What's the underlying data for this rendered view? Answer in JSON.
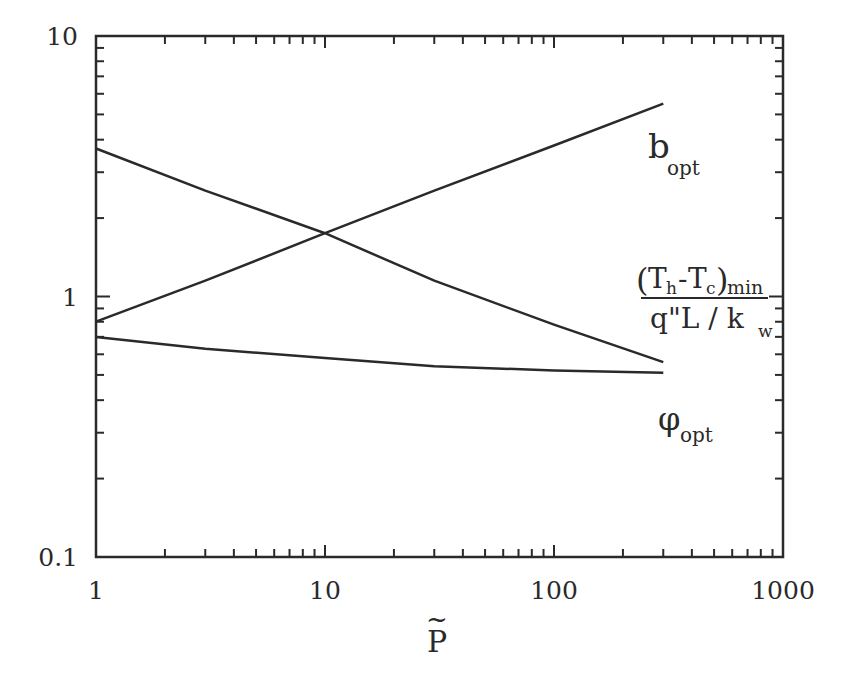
{
  "chart_data": {
    "type": "line",
    "title": "",
    "xlabel": "P̃",
    "ylabel": "",
    "xscale": "log",
    "yscale": "log",
    "xlim": [
      1,
      1000
    ],
    "ylim": [
      0.1,
      10
    ],
    "grid": false,
    "x_tick_labels": [
      "1",
      "10",
      "100",
      "1000"
    ],
    "y_tick_labels": [
      "0.1",
      "1",
      "10"
    ],
    "x": [
      1,
      3,
      10,
      30,
      100,
      300
    ],
    "series": [
      {
        "name": "b_opt",
        "values": [
          0.8,
          1.15,
          1.75,
          2.55,
          3.8,
          5.5
        ]
      },
      {
        "name": "(T_h - T_c)_min / (q\"L / k_w)",
        "values": [
          3.7,
          2.55,
          1.75,
          1.15,
          0.78,
          0.56
        ]
      },
      {
        "name": "φ_opt",
        "values": [
          0.7,
          0.63,
          0.58,
          0.54,
          0.52,
          0.51
        ]
      }
    ],
    "annotations": [
      {
        "text": "b_opt",
        "near": "upper line end"
      },
      {
        "text": "(T_h-T_c)_min / q\"L / k_w",
        "near": "descending line end"
      },
      {
        "text": "φ_opt",
        "near": "bottom line end"
      }
    ]
  },
  "axes": {
    "x_ticks": [
      "1",
      "10",
      "100",
      "1000"
    ],
    "y_ticks": [
      "10",
      "1",
      "0.1"
    ],
    "x_title": "P",
    "x_title_accent": "~"
  },
  "labels": {
    "b_main": "b",
    "b_sub": "opt",
    "t_open": "(",
    "t_h": "T",
    "t_h_sub": "h",
    "t_dash": "-",
    "t_c": "T",
    "t_c_sub": "c",
    "t_close": ")",
    "t_min": "min",
    "t_den": "q\"L / k",
    "t_den_sub": "w",
    "phi_main": "φ",
    "phi_sub": "opt"
  }
}
